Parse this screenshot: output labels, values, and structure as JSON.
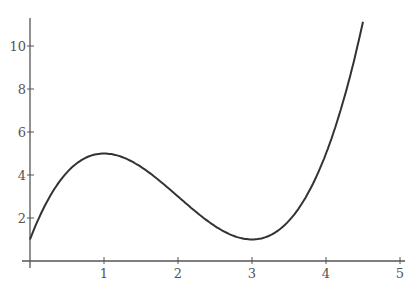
{
  "chart_data": {
    "type": "line",
    "title": "",
    "xlabel": "",
    "ylabel": "",
    "function": "x^3 - 6x^2 + 9x + 1",
    "xlim": [
      0,
      5
    ],
    "ylim": [
      0,
      11.5
    ],
    "x_ticks": [
      "1",
      "2",
      "3",
      "4",
      "5"
    ],
    "y_ticks": [
      "2",
      "4",
      "6",
      "8",
      "10"
    ],
    "grid": false,
    "legend": null,
    "series": [
      {
        "name": "f(x)",
        "x": [
          0,
          0.25,
          0.5,
          0.75,
          1,
          1.25,
          1.5,
          1.75,
          2,
          2.25,
          2.5,
          2.75,
          3,
          3.25,
          3.5,
          3.75,
          4,
          4.25,
          4.5
        ],
        "values": [
          1,
          2.64,
          3.63,
          4.61,
          5,
          4.89,
          4.38,
          3.58,
          3,
          2.27,
          1.63,
          1.17,
          1,
          1.2,
          1.88,
          3.11,
          5,
          7.63,
          11.13
        ]
      }
    ],
    "annotations": []
  }
}
